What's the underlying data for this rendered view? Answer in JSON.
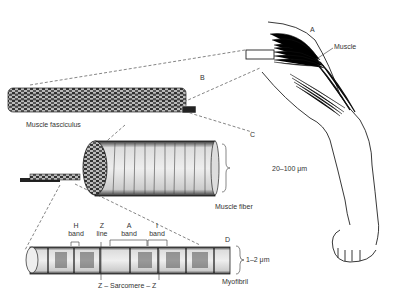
{
  "diagram": {
    "labels": {
      "A": "A",
      "B": "B",
      "C": "C",
      "D": "D",
      "muscle": "Muscle",
      "muscle_fasciculus": "Muscle fasciculus",
      "muscle_fiber": "Muscle fiber",
      "fiber_diameter": "20–100 μm",
      "myofibril": "Myofibril",
      "myofibril_diameter": "1–2 μm",
      "sarcomere": "Z – Sarcomere – Z"
    },
    "bands": [
      {
        "line1": "H",
        "line2": "band"
      },
      {
        "line1": "Z",
        "line2": "line"
      },
      {
        "line1": "A",
        "line2": "band"
      },
      {
        "line1": "I",
        "line2": "band"
      }
    ]
  }
}
